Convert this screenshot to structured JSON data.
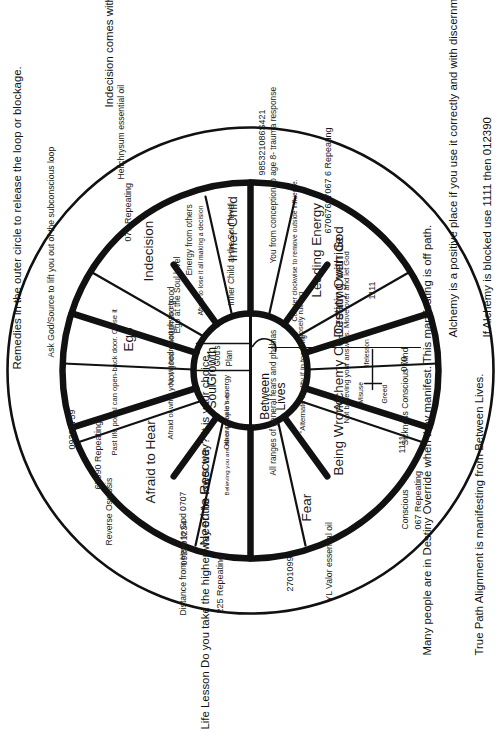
{
  "diagram": {
    "center": {
      "top_label": "Soul",
      "top_label2": "Growth",
      "bottom_label": "Between",
      "bottom_label2": "Lives",
      "gods": "God's",
      "plan": "Plan"
    },
    "notes": {
      "top_right": "Remedies in the outer circle to release the loop or blockage.",
      "far_right": "Indecision comes with right shoulder pain.",
      "bottom_left_1": "Many people are in Destiny Override when they manifest. This manifesting is off path.",
      "bottom_left_2": "True Path Alignment is manifesting from Between Lives.",
      "bottom_left_3": "Life Lesson Do you take the higher way or the lower way? It is your choice.",
      "bottom_right_1": "Alchemy is a positive place if you use it correctly and with discernment. Ask if it is in your highest good.  Yes or No",
      "bottom_right_2": "If Alchemy is blocked use 1111 then 012390"
    },
    "segments": [
      {
        "name": "Afraid to Hear",
        "sub": [
          "Past life portal can open-back door. Close it",
          "Afraid of what you will hear. Bad news etc."
        ],
        "ring_text": "Reverse Osmosis",
        "ring_numbers": [
          "67090 Repeating",
          "09321759"
        ],
        "remedy": ""
      },
      {
        "name": "Ego",
        "sub": [
          "Not good enough too good",
          "Ego at the Soul level"
        ],
        "ring_text": "Ask God/Source to lift you out of the subconscious loop",
        "ring_numbers": [],
        "remedy": ""
      },
      {
        "name": "Indecision",
        "sub": [
          "Afraid to lose it all making a decision",
          "Energy from others"
        ],
        "ring_text": "Helichrysum essential oil",
        "ring_numbers": [
          "071 Repeating"
        ],
        "remedy": ""
      },
      {
        "name": "Inner Child",
        "sub": [
          "Inner Child at the Soul level",
          "You from conception to age 8- trauma response"
        ],
        "ring_text": "",
        "ring_numbers": [
          "985321086S421"
        ],
        "remedy": ""
      },
      {
        "name": "Leading Energy",
        "sub": [],
        "ring_text": "",
        "ring_numbers": [
          "67067667067 6 Repeating"
        ],
        "remedy": ""
      },
      {
        "name": "Destiny Override",
        "sub": [
          "Counter clockwise to remove outside influence.",
          "purposely ruining"
        ],
        "ring_text": "",
        "ring_numbers": [
          "1111"
        ],
        "remedy": ""
      },
      {
        "name": "Alchemy Co-Creating with God",
        "sub": [
          "Misuse",
          "Greed",
          "lifelesson"
        ],
        "ring_text": "Sickness Conscious Mind",
        "ring_numbers": [
          "070"
        ],
        "remedy": ""
      },
      {
        "name": "Being Wrong",
        "sub": [
          "\"Alternate reality if in too long\"",
          "Not believing your answers. Move over and let God"
        ],
        "ring_text": "Conscious",
        "ring_numbers": [
          "1111",
          "067 Repeating"
        ],
        "remedy": ""
      },
      {
        "name": "Fear",
        "sub": [
          "All ranges of general fears and phobias"
        ],
        "ring_text": "YL Valor essential oil",
        "ring_numbers": [
          "2701099"
        ],
        "remedy": ""
      },
      {
        "name": "Need to Rescue",
        "sub": [
          "Believing you are the only one to help.",
          "Other people's energy"
        ],
        "ring_text": "Distance from Here to God 0707",
        "ring_numbers": [
          "225 Repeating",
          "092391234"
        ],
        "remedy": ""
      }
    ],
    "colors": {
      "ink": "#111111",
      "paper": "#ffffff"
    }
  }
}
